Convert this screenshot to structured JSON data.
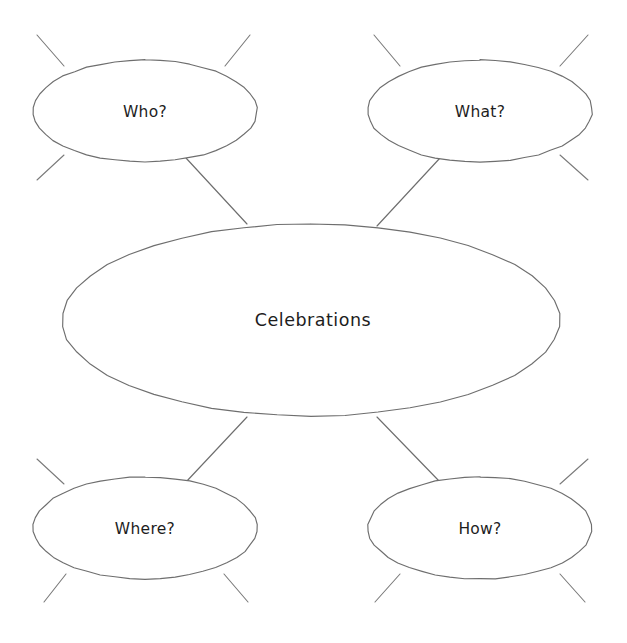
{
  "document": {
    "type": "concept-map",
    "style": "hand-drawn",
    "background_color": "#ffffff",
    "stroke_color": "#6e6e6e",
    "text_color": "#1d1d1d",
    "width": 627,
    "height": 643
  },
  "center": {
    "label": "Celebrations",
    "cx": 311,
    "cy": 320,
    "rx": 249,
    "ry": 96
  },
  "nodes": [
    {
      "id": "who",
      "label": "Who?",
      "cx": 145,
      "cy": 111,
      "rx": 112,
      "ry": 51,
      "position": "top-left"
    },
    {
      "id": "what",
      "label": "What?",
      "cx": 480,
      "cy": 111,
      "rx": 112,
      "ry": 51,
      "position": "top-right"
    },
    {
      "id": "where",
      "label": "Where?",
      "cx": 145,
      "cy": 528,
      "rx": 112,
      "ry": 51,
      "position": "bottom-left"
    },
    {
      "id": "how",
      "label": "How?",
      "cx": 480,
      "cy": 528,
      "rx": 112,
      "ry": 51,
      "position": "bottom-right"
    }
  ],
  "connectors": [
    {
      "id": "who-to-center",
      "from": "who",
      "to": "center",
      "x1": 186,
      "y1": 158,
      "x2": 247,
      "y2": 224
    },
    {
      "id": "what-to-center",
      "from": "what",
      "to": "center",
      "x1": 440,
      "y1": 158,
      "x2": 377,
      "y2": 226
    },
    {
      "id": "where-to-center",
      "from": "where",
      "to": "center",
      "x1": 186,
      "y1": 482,
      "x2": 247,
      "y2": 417
    },
    {
      "id": "how-to-center",
      "from": "how",
      "to": "center",
      "x1": 440,
      "y1": 482,
      "x2": 377,
      "y2": 417
    }
  ],
  "spokes": [
    {
      "id": "who-spoke-nw",
      "node": "who",
      "x1": 64,
      "y1": 66,
      "x2": 37,
      "y2": 35
    },
    {
      "id": "who-spoke-ne",
      "node": "who",
      "x1": 225,
      "y1": 66,
      "x2": 250,
      "y2": 35
    },
    {
      "id": "who-spoke-sw",
      "node": "who",
      "x1": 64,
      "y1": 155,
      "x2": 37,
      "y2": 180
    },
    {
      "id": "what-spoke-nw",
      "node": "what",
      "x1": 400,
      "y1": 66,
      "x2": 374,
      "y2": 35
    },
    {
      "id": "what-spoke-ne",
      "node": "what",
      "x1": 560,
      "y1": 66,
      "x2": 588,
      "y2": 35
    },
    {
      "id": "what-spoke-se",
      "node": "what",
      "x1": 560,
      "y1": 155,
      "x2": 588,
      "y2": 180
    },
    {
      "id": "where-spoke-nw",
      "node": "where",
      "x1": 64,
      "y1": 484,
      "x2": 37,
      "y2": 459
    },
    {
      "id": "where-spoke-sw",
      "node": "where",
      "x1": 66,
      "y1": 574,
      "x2": 44,
      "y2": 602
    },
    {
      "id": "where-spoke-se",
      "node": "where",
      "x1": 224,
      "y1": 574,
      "x2": 248,
      "y2": 602
    },
    {
      "id": "how-spoke-ne",
      "node": "how",
      "x1": 560,
      "y1": 484,
      "x2": 588,
      "y2": 459
    },
    {
      "id": "how-spoke-sw",
      "node": "how",
      "x1": 400,
      "y1": 574,
      "x2": 375,
      "y2": 602
    },
    {
      "id": "how-spoke-se",
      "node": "how",
      "x1": 560,
      "y1": 574,
      "x2": 585,
      "y2": 602
    }
  ]
}
